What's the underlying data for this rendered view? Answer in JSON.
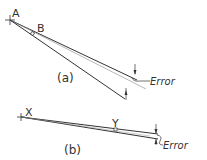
{
  "diagram": {
    "part_a": {
      "caption": "(a)",
      "point_labels": [
        "A",
        "B"
      ],
      "error_label": "Error"
    },
    "part_b": {
      "caption": "(b)",
      "point_labels": [
        "X",
        "Y"
      ],
      "error_label": "Error"
    },
    "colors": {
      "line": "#333333",
      "thin_line": "#777777",
      "background": "#ffffff"
    }
  }
}
